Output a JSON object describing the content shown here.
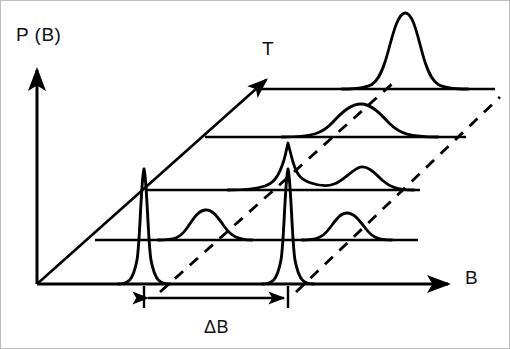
{
  "figure": {
    "kind": "waterfall-3d-lineplot",
    "background_color": "#ffffff",
    "stroke_color": "#000000",
    "border_color": "#b9b9b9"
  },
  "axes": {
    "vertical": {
      "name": "probability-axis",
      "label": "P (B)",
      "arrow": true,
      "from": [
        37,
        284
      ],
      "to": [
        37,
        68
      ]
    },
    "horizontal": {
      "name": "field-axis",
      "label": "B",
      "arrow": true,
      "from": [
        37,
        284
      ],
      "to": [
        452,
        284
      ]
    },
    "depth": {
      "name": "temperature-axis",
      "label": "T",
      "arrow": true,
      "from": [
        37,
        284
      ],
      "to": [
        262,
        84
      ]
    }
  },
  "annotations": {
    "delta_b": {
      "label": "ΔB",
      "description": "peak separation",
      "x_start": 144,
      "x_end": 288,
      "y": 297,
      "double_arrow": true,
      "ticks": true
    }
  },
  "levels": [
    {
      "index": 0,
      "name": "level-bottom",
      "baseline_y": 284,
      "baseline_x_start": 37,
      "baseline_x_end": 452,
      "peaks": [
        {
          "center": 144,
          "height": 121,
          "width": 13,
          "shape": "sharp"
        },
        {
          "center": 288,
          "height": 121,
          "width": 13,
          "shape": "sharp"
        }
      ]
    },
    {
      "index": 1,
      "name": "level-2",
      "baseline_y": 240,
      "baseline_x_start": 95,
      "baseline_x_end": 418,
      "peaks": [
        {
          "center": 200,
          "height": 30,
          "width": 36,
          "shape": "broad"
        },
        {
          "center": 338,
          "height": 27,
          "width": 34,
          "shape": "broad"
        }
      ]
    },
    {
      "index": 2,
      "name": "level-3",
      "baseline_y": 190,
      "baseline_x_start": 146,
      "baseline_x_end": 420,
      "peaks": [
        {
          "center": 288,
          "height": 49,
          "width": 30,
          "shape": "mixed"
        },
        {
          "center": 358,
          "height": 22,
          "width": 30,
          "shape": "broad"
        }
      ]
    },
    {
      "index": 3,
      "name": "level-4",
      "baseline_y": 137,
      "baseline_x_start": 205,
      "baseline_x_end": 466,
      "peaks": [
        {
          "center": 360,
          "height": 33,
          "width": 46,
          "shape": "broad"
        }
      ]
    },
    {
      "index": 4,
      "name": "level-top",
      "baseline_y": 89,
      "baseline_x_start": 258,
      "baseline_x_end": 495,
      "peaks": [
        {
          "center": 405,
          "height": 82,
          "width": 33,
          "shape": "tall"
        }
      ]
    }
  ],
  "guide_lines": [
    {
      "name": "dashed-guide-left",
      "from": [
        160,
        290
      ],
      "to": [
        390,
        85
      ],
      "style": "dashed"
    },
    {
      "name": "dashed-guide-right",
      "from": [
        296,
        290
      ],
      "to": [
        498,
        95
      ],
      "style": "dashed"
    }
  ]
}
